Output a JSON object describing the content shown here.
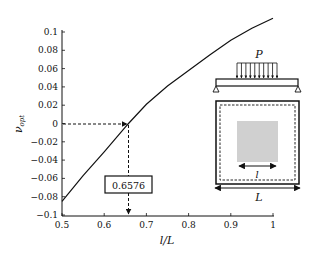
{
  "chart_data": {
    "type": "line",
    "title": "",
    "xlabel": "l/L",
    "ylabel": "ν_opt",
    "ylabel_main": "ν",
    "ylabel_sub": "opt",
    "xlim": [
      0.5,
      1.0
    ],
    "ylim": [
      -0.1,
      0.1
    ],
    "grid": false,
    "x_ticks": [
      "0.5",
      "0.6",
      "0.7",
      "0.8",
      "0.9",
      "1"
    ],
    "y_ticks": [
      "0.1",
      "0.08",
      "0.06",
      "0.04",
      "0.02",
      "0",
      "−0.02",
      "−0.04",
      "−0.06",
      "−0.08",
      "−0.1"
    ],
    "series": [
      {
        "name": "nu_opt",
        "x": [
          0.5,
          0.55,
          0.6,
          0.65,
          0.6576,
          0.7,
          0.75,
          0.8,
          0.85,
          0.9,
          0.95,
          1.0
        ],
        "y": [
          -0.085,
          -0.057,
          -0.031,
          -0.004,
          0.0,
          0.021,
          0.041,
          0.058,
          0.075,
          0.091,
          0.104,
          0.115
        ]
      }
    ],
    "annotations": [
      {
        "type": "dashed-arrow-horizontal",
        "from": [
          0.5,
          0
        ],
        "to": [
          0.6576,
          0
        ]
      },
      {
        "type": "dashed-arrow-vertical",
        "from": [
          0.6576,
          0
        ],
        "to": [
          0.6576,
          -0.1
        ]
      },
      {
        "type": "boxed-label",
        "text": "0.6576",
        "at_x": 0.6576
      }
    ]
  },
  "annotation": {
    "value_label": "0.6576"
  },
  "inset": {
    "load_label": "P",
    "inner_dim_label": "l",
    "outer_dim_label": "L",
    "patch_color": "#d0d0d0",
    "load_arrow_count": 10
  }
}
